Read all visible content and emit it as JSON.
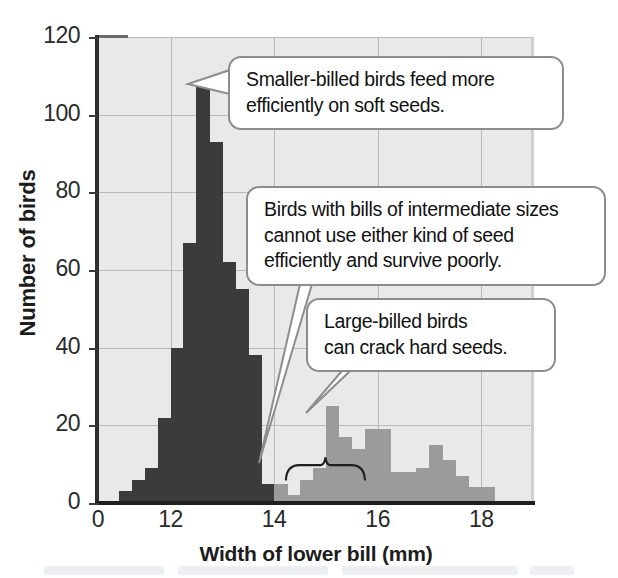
{
  "chart_data": {
    "type": "bar",
    "title": "",
    "subtitle": "",
    "xlabel": "Width of lower bill (mm)",
    "ylabel": "Number of birds",
    "xlim": [
      10.6,
      19.0
    ],
    "ylim": [
      0,
      120
    ],
    "xticks": [
      0,
      12,
      14,
      16,
      18
    ],
    "xtick_labels": [
      "0",
      "12",
      "14",
      "16",
      "18"
    ],
    "yticks": [
      0,
      20,
      40,
      60,
      80,
      100,
      120
    ],
    "ytick_labels": [
      "0",
      "20",
      "40",
      "60",
      "80",
      "100",
      "120"
    ],
    "grid": true,
    "legend_position": "none",
    "bin_width": 0.25,
    "series": [
      {
        "name": "Smaller-billed birds (soft seeds)",
        "color": "#3b3b3b",
        "x": [
          11.25,
          11.5,
          11.75,
          12.0,
          12.25,
          12.5,
          12.75,
          13.0,
          13.25,
          13.5,
          13.75,
          14.0
        ],
        "values": [
          3,
          6,
          9,
          22,
          40,
          67,
          108,
          93,
          62,
          55,
          38,
          5
        ]
      },
      {
        "name": "Larger-billed birds (hard seeds)",
        "color": "#9b9b9b",
        "x": [
          14.25,
          14.5,
          14.75,
          15.0,
          15.25,
          15.5,
          15.75,
          16.0,
          16.25,
          16.5,
          16.75,
          17.0,
          17.25,
          17.5,
          17.75,
          18.0,
          18.25
        ],
        "values": [
          5,
          2,
          6,
          9,
          25,
          17,
          14,
          19,
          19,
          8,
          8,
          9,
          15,
          11,
          7,
          4,
          4
        ]
      }
    ],
    "annotations": [
      {
        "name": "smaller-billed-callout",
        "text": "Smaller-billed birds feed more efficiently on soft seeds.",
        "lines": [
          "Smaller-billed birds feed more",
          "efficiently on soft seeds."
        ],
        "points_to_x": 12.85,
        "points_to_y": 108
      },
      {
        "name": "intermediate-callout",
        "text": "Birds with bills of intermediate sizes cannot use either kind of seed efficiently and survive poorly.",
        "lines": [
          "Birds with bills of intermediate sizes",
          "cannot use either kind of seed",
          "efficiently and survive poorly."
        ],
        "points_to_x": 14.5,
        "points_to_y": 8
      },
      {
        "name": "large-billed-callout",
        "text": "Large-billed birds can crack hard seeds.",
        "lines": [
          "Large-billed birds",
          "can crack hard seeds."
        ],
        "points_to_x": 15.3,
        "points_to_y": 25
      }
    ],
    "brace": {
      "name": "intermediate-size-brace",
      "x_start": 14.2,
      "x_end": 15.8
    }
  },
  "colors": {
    "soft_seed_bars": "#3b3b3b",
    "hard_seed_bars": "#9b9b9b",
    "plot_background": "#e9e9e9",
    "gridlines": "#b9b9b9",
    "axis": "#1f1f1f",
    "callout_border": "#8d8d8d",
    "callout_fill": "#ffffff",
    "text": "#111111"
  }
}
